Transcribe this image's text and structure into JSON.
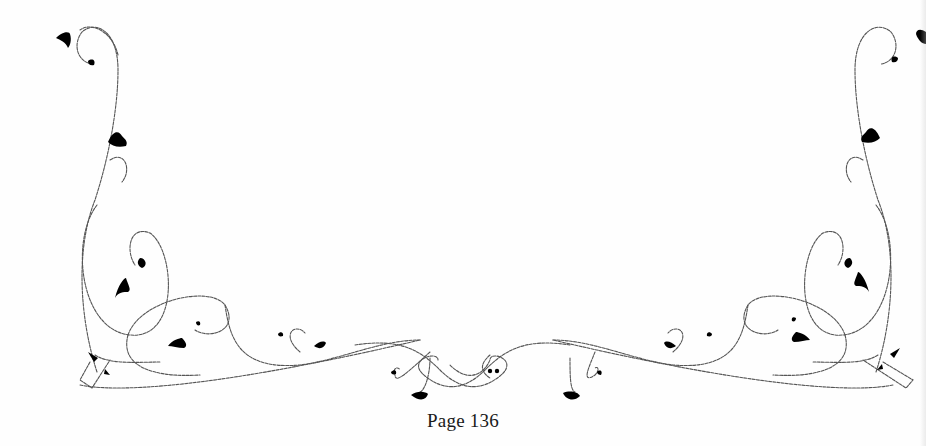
{
  "page": {
    "number_label": "Page 136",
    "background": "#fefefe",
    "ink_color": "#000000"
  },
  "ornament": {
    "name": "floral-vine-border",
    "elements": [
      "left-corner-vine",
      "right-corner-vine",
      "bottom-center-flourish"
    ]
  }
}
